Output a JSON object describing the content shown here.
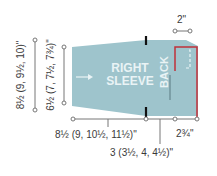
{
  "diagram": {
    "piece_label_line1": "RIGHT",
    "piece_label_line2": "SLEEVE",
    "back_label": "BACK",
    "dimensions": {
      "outer_height": "8½ (9, 9½, 10)\"",
      "inner_height": "6½ (7, 7½, 7¾)\"",
      "bottom_length": "8½ (9, 10½, 11½)\"",
      "back_length": "3 (3½, 4, 4½)\"",
      "corner_width": "2¾\"",
      "top_width": "2\""
    },
    "colors": {
      "piece_fill": "#9ec4cc",
      "accent_red": "#c0303a",
      "marker": "#111111",
      "dim_line": "#777777"
    }
  }
}
